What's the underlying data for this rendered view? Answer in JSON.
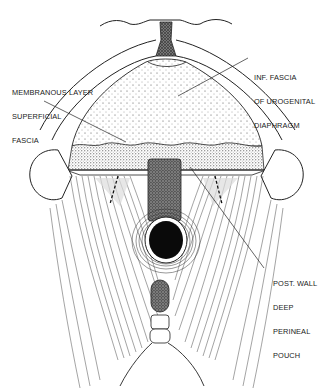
{
  "figure": {
    "type": "anatomical-illustration",
    "ink_color": "#1a1a1a",
    "background_color": "#ffffff"
  },
  "labels": [
    {
      "id": "membranous",
      "lines": [
        "MEMBRANOUS LAYER",
        "SUPERFICIAL",
        "FASCIA"
      ]
    },
    {
      "id": "inf_fascia",
      "lines": [
        "INF. FASCIA",
        "OF UROGENITAL",
        "DIAPHRAGM"
      ]
    },
    {
      "id": "post_wall",
      "lines": [
        "POST. WALL",
        "DEEP",
        "PERINEAL",
        "POUCH"
      ]
    }
  ]
}
